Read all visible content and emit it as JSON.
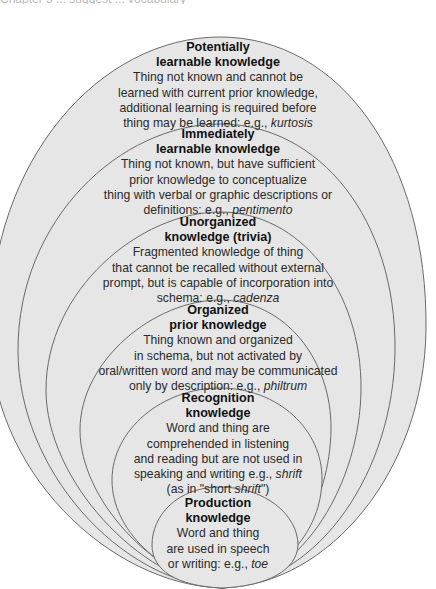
{
  "header_fragment": "Chapter 3 ... suggest ... vocabulary",
  "colors": {
    "fill": "#e6e6e6",
    "stroke": "#6a6a6a",
    "background": "#ffffff"
  },
  "levels": [
    {
      "title": [
        "Potentially",
        "learnable knowledge"
      ],
      "desc": [
        "Thing not known and cannot be",
        "learned with current prior knowledge,",
        "additional learning is required before"
      ],
      "last_prefix": "thing may be learned: e.g., ",
      "example": "kurtosis"
    },
    {
      "title": [
        "Immediately",
        "learnable knowledge"
      ],
      "desc": [
        "Thing not known, but have sufficient",
        "prior knowledge to conceptualize",
        "thing with verbal or graphic descriptions or"
      ],
      "last_prefix": "definitions: e.g., ",
      "example": "pentimento"
    },
    {
      "title": [
        "Unorganized",
        "knowledge (trivia)"
      ],
      "desc": [
        "Fragmented knowledge of thing",
        "that cannot be recalled without external",
        "prompt, but is capable of incorporation into"
      ],
      "last_prefix": "schema: e.g., ",
      "example": "cadenza"
    },
    {
      "title": [
        "Organized",
        "prior knowledge"
      ],
      "desc": [
        "Thing known and organized",
        "in schema, but not activated by",
        "oral/written word and may be communicated"
      ],
      "last_prefix": "only by description: e.g., ",
      "example": "philtrum"
    },
    {
      "title": [
        "Recognition",
        "knowledge"
      ],
      "desc": [
        "Word and thing are",
        "comprehended in listening",
        "and reading but are not used in"
      ],
      "last_prefix": "speaking and writing e.g., ",
      "example": "shrift",
      "extra_prefix": "(as in \"short ",
      "extra_italic": "shrift",
      "extra_suffix": "\")"
    },
    {
      "title": [
        "Production",
        "knowledge"
      ],
      "desc": [
        "Word and thing",
        "are used in speech"
      ],
      "last_prefix": "or writing: e.g., ",
      "example": "toe"
    }
  ]
}
